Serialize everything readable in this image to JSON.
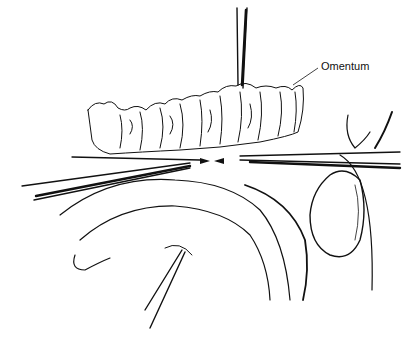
{
  "figure": {
    "type": "surgical line illustration",
    "labels": [
      {
        "id": "omentum",
        "text": "Omentum"
      }
    ],
    "colors": {
      "ink": "#111111",
      "background": "#ffffff"
    }
  }
}
